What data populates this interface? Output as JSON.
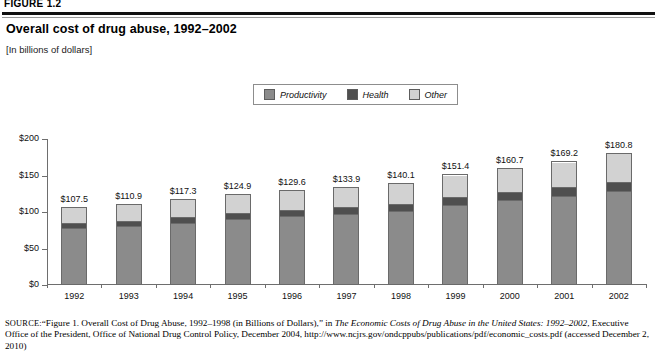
{
  "figure": {
    "header_label": "FIGURE 1.2",
    "title": "Overall cost of drug abuse, 1992–2002",
    "subtitle": "[In billions of dollars]"
  },
  "legend": {
    "items": [
      {
        "label": "Productivity",
        "color": "#8b8b8b",
        "icon": "legend-swatch-icon"
      },
      {
        "label": "Health",
        "color": "#4f4f4f",
        "icon": "legend-swatch-icon"
      },
      {
        "label": "Other",
        "color": "#d2d2d2",
        "icon": "legend-swatch-icon"
      }
    ]
  },
  "source": {
    "prefix": "SOURCE:",
    "part1": "“Figure 1. Overall Cost of Drug Abuse, 1992–1998 (in Billions of Dollars),” in ",
    "italic1": "The Economic Costs of Drug Abuse in the United States: 1992–2002",
    "part2": ", Executive Office of the President, Office of National Drug Control Policy, December 2004, http://www.ncjrs.gov/ondcppubs/publications/pdf/economic_costs.pdf (accessed December 2, 2010)"
  },
  "chart_data": {
    "type": "bar",
    "subtype": "stacked-bar",
    "title": "Overall cost of drug abuse, 1992–2002",
    "xlabel": "",
    "ylabel": "",
    "ylim": [
      0,
      200
    ],
    "yticks": [
      0,
      50,
      100,
      150,
      200
    ],
    "ytick_labels": [
      "$0",
      "$50",
      "$100",
      "$150",
      "$200"
    ],
    "grid": false,
    "legend_position": "top-center",
    "categories": [
      "1992",
      "1993",
      "1994",
      "1995",
      "1996",
      "1997",
      "1998",
      "1999",
      "2000",
      "2001",
      "2002"
    ],
    "totals": [
      107.5,
      110.9,
      117.3,
      124.9,
      129.6,
      133.9,
      140.1,
      151.4,
      160.7,
      169.2,
      180.8
    ],
    "total_labels": [
      "$107.5",
      "$110.9",
      "$117.3",
      "$124.9",
      "$129.6",
      "$133.9",
      "$140.1",
      "$151.4",
      "$160.7",
      "$169.2",
      "$180.8"
    ],
    "series": [
      {
        "name": "Productivity",
        "color": "#8b8b8b",
        "values": [
          77.4,
          79.8,
          84.4,
          89.9,
          93.3,
          96.4,
          100.9,
          109.0,
          115.7,
          121.8,
          128.3
        ]
      },
      {
        "name": "Health",
        "color": "#4f4f4f",
        "values": [
          7.5,
          7.8,
          8.2,
          8.7,
          9.1,
          9.4,
          9.8,
          10.6,
          11.2,
          11.8,
          12.7
        ]
      },
      {
        "name": "Other",
        "color": "#d2d2d2",
        "values": [
          22.6,
          23.3,
          24.7,
          26.3,
          27.2,
          28.1,
          29.4,
          31.8,
          33.8,
          35.6,
          39.8
        ]
      }
    ]
  }
}
